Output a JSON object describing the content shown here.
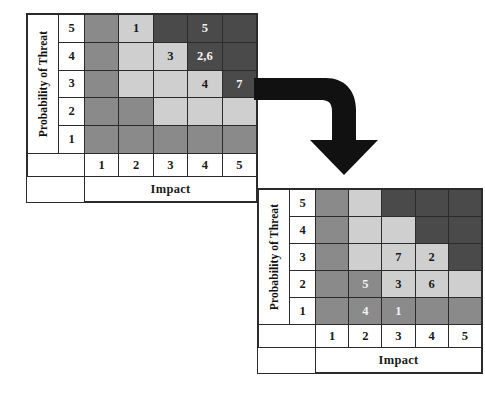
{
  "page": {
    "background_color": "#ffffff"
  },
  "legend_colors": {
    "low": "#8a8a8a",
    "medium": "#cfcfcf",
    "high": "#4a4a4a",
    "border": "#2b2b2b",
    "arrow": "#111111"
  },
  "arrow": {
    "name": "elbow-arrow-down",
    "direction": "right-then-down",
    "color": "#111111"
  },
  "matrices": [
    {
      "id": "before",
      "y_axis_label": "Probability of Threat",
      "x_axis_label": "Impact",
      "y_ticks": [
        "5",
        "4",
        "3",
        "2",
        "1"
      ],
      "x_ticks": [
        "1",
        "2",
        "3",
        "4",
        "5"
      ],
      "rows": [
        {
          "probability": "5",
          "cells": [
            {
              "impact": "1",
              "level": "med",
              "label": ""
            },
            {
              "impact": "2",
              "level": "light",
              "label": "1"
            },
            {
              "impact": "3",
              "level": "dark",
              "label": ""
            },
            {
              "impact": "4",
              "level": "dark",
              "label": "5"
            },
            {
              "impact": "5",
              "level": "dark",
              "label": ""
            }
          ]
        },
        {
          "probability": "4",
          "cells": [
            {
              "impact": "1",
              "level": "med",
              "label": ""
            },
            {
              "impact": "2",
              "level": "light",
              "label": ""
            },
            {
              "impact": "3",
              "level": "light",
              "label": "3"
            },
            {
              "impact": "4",
              "level": "dark",
              "label": "2,6"
            },
            {
              "impact": "5",
              "level": "dark",
              "label": ""
            }
          ]
        },
        {
          "probability": "3",
          "cells": [
            {
              "impact": "1",
              "level": "med",
              "label": ""
            },
            {
              "impact": "2",
              "level": "light",
              "label": ""
            },
            {
              "impact": "3",
              "level": "light",
              "label": ""
            },
            {
              "impact": "4",
              "level": "light",
              "label": "4"
            },
            {
              "impact": "5",
              "level": "dark",
              "label": "7"
            }
          ]
        },
        {
          "probability": "2",
          "cells": [
            {
              "impact": "1",
              "level": "med",
              "label": ""
            },
            {
              "impact": "2",
              "level": "med",
              "label": ""
            },
            {
              "impact": "3",
              "level": "light",
              "label": ""
            },
            {
              "impact": "4",
              "level": "light",
              "label": ""
            },
            {
              "impact": "5",
              "level": "light",
              "label": ""
            }
          ]
        },
        {
          "probability": "1",
          "cells": [
            {
              "impact": "1",
              "level": "med",
              "label": ""
            },
            {
              "impact": "2",
              "level": "med",
              "label": ""
            },
            {
              "impact": "3",
              "level": "med",
              "label": ""
            },
            {
              "impact": "4",
              "level": "med",
              "label": ""
            },
            {
              "impact": "5",
              "level": "med",
              "label": ""
            }
          ]
        }
      ]
    },
    {
      "id": "after",
      "y_axis_label": "Probability of Threat",
      "x_axis_label": "Impact",
      "y_ticks": [
        "5",
        "4",
        "3",
        "2",
        "1"
      ],
      "x_ticks": [
        "1",
        "2",
        "3",
        "4",
        "5"
      ],
      "rows": [
        {
          "probability": "5",
          "cells": [
            {
              "impact": "1",
              "level": "med",
              "label": ""
            },
            {
              "impact": "2",
              "level": "light",
              "label": ""
            },
            {
              "impact": "3",
              "level": "dark",
              "label": ""
            },
            {
              "impact": "4",
              "level": "dark",
              "label": ""
            },
            {
              "impact": "5",
              "level": "dark",
              "label": ""
            }
          ]
        },
        {
          "probability": "4",
          "cells": [
            {
              "impact": "1",
              "level": "med",
              "label": ""
            },
            {
              "impact": "2",
              "level": "light",
              "label": ""
            },
            {
              "impact": "3",
              "level": "light",
              "label": ""
            },
            {
              "impact": "4",
              "level": "dark",
              "label": ""
            },
            {
              "impact": "5",
              "level": "dark",
              "label": ""
            }
          ]
        },
        {
          "probability": "3",
          "cells": [
            {
              "impact": "1",
              "level": "med",
              "label": ""
            },
            {
              "impact": "2",
              "level": "light",
              "label": ""
            },
            {
              "impact": "3",
              "level": "light",
              "label": "7"
            },
            {
              "impact": "4",
              "level": "light",
              "label": "2"
            },
            {
              "impact": "5",
              "level": "dark",
              "label": ""
            }
          ]
        },
        {
          "probability": "2",
          "cells": [
            {
              "impact": "1",
              "level": "med",
              "label": ""
            },
            {
              "impact": "2",
              "level": "med",
              "label": "5"
            },
            {
              "impact": "3",
              "level": "light",
              "label": "3"
            },
            {
              "impact": "4",
              "level": "light",
              "label": "6"
            },
            {
              "impact": "5",
              "level": "light",
              "label": ""
            }
          ]
        },
        {
          "probability": "1",
          "cells": [
            {
              "impact": "1",
              "level": "med",
              "label": ""
            },
            {
              "impact": "2",
              "level": "med",
              "label": "4"
            },
            {
              "impact": "3",
              "level": "med",
              "label": "1"
            },
            {
              "impact": "4",
              "level": "med",
              "label": ""
            },
            {
              "impact": "5",
              "level": "med",
              "label": ""
            }
          ]
        }
      ]
    }
  ]
}
